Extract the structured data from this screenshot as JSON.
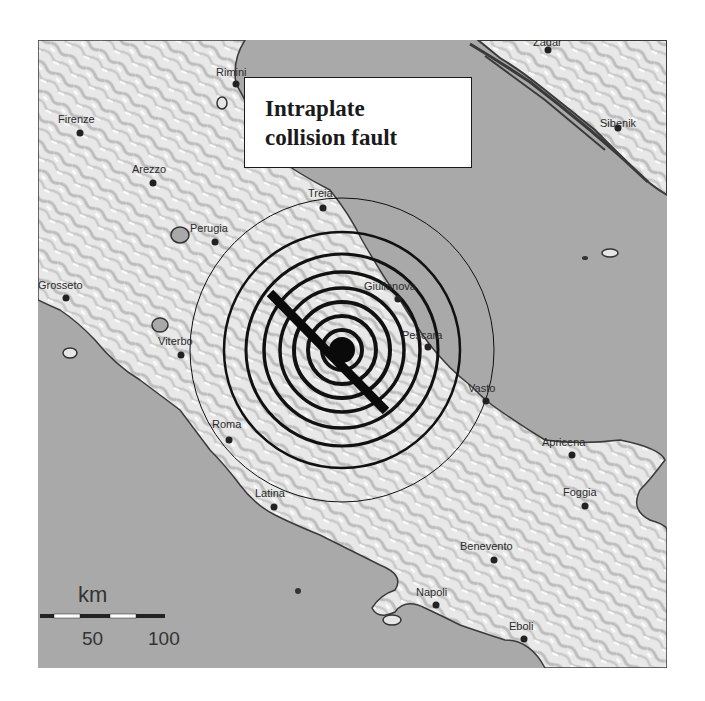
{
  "figure": {
    "title_line1": "Intraplate",
    "title_line2": "collision fault"
  },
  "colors": {
    "sea": "#a9a9a9",
    "land": "#e6e6e6",
    "relief_shadow": "#b8b8b8",
    "coastline": "#3a3a3a",
    "rings": "#111111",
    "fault": "#0a0a0a",
    "city_dot": "#222222"
  },
  "epicenter": {
    "x": 342,
    "y": 350
  },
  "rings": [
    {
      "radius": 20,
      "stroke": 4
    },
    {
      "radius": 34,
      "stroke": 4
    },
    {
      "radius": 48,
      "stroke": 4
    },
    {
      "radius": 62,
      "stroke": 3.5
    },
    {
      "radius": 78,
      "stroke": 3.5
    },
    {
      "radius": 96,
      "stroke": 3
    },
    {
      "radius": 118,
      "stroke": 2.5
    },
    {
      "radius": 152,
      "stroke": 1
    }
  ],
  "fault_line": {
    "x1": 270,
    "y1": 293,
    "x2": 386,
    "y2": 411,
    "width": 9
  },
  "cities": [
    {
      "name": "Rimini",
      "x": 236,
      "y": 84,
      "lx": 216,
      "ly": 76
    },
    {
      "name": "Firenze",
      "x": 80,
      "y": 133,
      "lx": 58,
      "ly": 123
    },
    {
      "name": "Arezzo",
      "x": 153,
      "y": 183,
      "lx": 132,
      "ly": 173
    },
    {
      "name": "Perugia",
      "x": 215,
      "y": 242,
      "lx": 190,
      "ly": 232
    },
    {
      "name": "Treia",
      "x": 323,
      "y": 208,
      "lx": 308,
      "ly": 197
    },
    {
      "name": "Grosseto",
      "x": 66,
      "y": 298,
      "lx": 38,
      "ly": 289
    },
    {
      "name": "Giulianova",
      "x": 398,
      "y": 299,
      "lx": 364,
      "ly": 290
    },
    {
      "name": "Viterbo",
      "x": 181,
      "y": 355,
      "lx": 158,
      "ly": 345
    },
    {
      "name": "Pescara",
      "x": 428,
      "y": 347,
      "lx": 402,
      "ly": 339
    },
    {
      "name": "Vasto",
      "x": 486,
      "y": 401,
      "lx": 468,
      "ly": 392
    },
    {
      "name": "Roma",
      "x": 229,
      "y": 440,
      "lx": 212,
      "ly": 428
    },
    {
      "name": "Apricena",
      "x": 572,
      "y": 455,
      "lx": 542,
      "ly": 446
    },
    {
      "name": "Latina",
      "x": 274,
      "y": 507,
      "lx": 255,
      "ly": 497
    },
    {
      "name": "Foggia",
      "x": 585,
      "y": 506,
      "lx": 563,
      "ly": 496
    },
    {
      "name": "Benevento",
      "x": 494,
      "y": 560,
      "lx": 460,
      "ly": 550
    },
    {
      "name": "Napoli",
      "x": 436,
      "y": 605,
      "lx": 416,
      "ly": 596
    },
    {
      "name": "Eboli",
      "x": 524,
      "y": 639,
      "lx": 509,
      "ly": 630
    },
    {
      "name": "Zadar",
      "x": 548,
      "y": 50,
      "lx": 533,
      "ly": 46
    },
    {
      "name": "Sibenik",
      "x": 618,
      "y": 128,
      "lx": 600,
      "ly": 127
    }
  ],
  "scale_bar": {
    "unit": "km",
    "tick_labels": [
      "50",
      "100"
    ]
  }
}
